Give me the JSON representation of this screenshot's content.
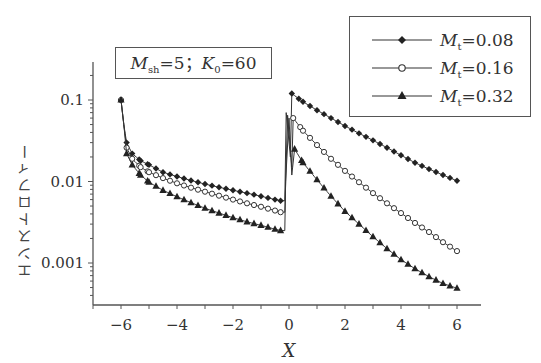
{
  "chart_data": {
    "type": "line",
    "title": "",
    "xlabel": "X",
    "ylabel": "エンストロフィー",
    "yscale": "log",
    "xlim": [
      -7,
      7.2
    ],
    "ylim": [
      0.0003,
      0.25
    ],
    "x_ticks": [
      -6,
      -4,
      -2,
      0,
      2,
      4,
      6
    ],
    "x_tick_labels": [
      "−6",
      "−4",
      "−2",
      "0",
      "2",
      "4",
      "6"
    ],
    "y_ticks": [
      0.1,
      0.01,
      0.001
    ],
    "y_tick_labels": [
      "0.1",
      "0.01",
      "0.001"
    ],
    "grid": false,
    "annotation": {
      "var1": "M",
      "sub1": "sh",
      "val1": "=5",
      "sep": "；",
      "var2": "K",
      "sub2": "0",
      "val2": "=60"
    },
    "legend_position": "upper right",
    "series": [
      {
        "name": "Mt=0.08",
        "legend_var": "M",
        "legend_sub": "t",
        "legend_val": "=0.08",
        "marker": "filled-diamond",
        "pre_shock": {
          "x": [
            -6.0,
            -5.9,
            -5.8,
            -5.6,
            -5.3,
            -5.0,
            -4.5,
            -4.0,
            -3.5,
            -3.0,
            -2.5,
            -2.0,
            -1.5,
            -1.0,
            -0.5,
            -0.3
          ],
          "y": [
            0.1,
            0.05,
            0.03,
            0.022,
            0.018,
            0.016,
            0.013,
            0.0115,
            0.0103,
            0.0093,
            0.0085,
            0.0078,
            0.0072,
            0.0066,
            0.006,
            0.0058
          ]
        },
        "post_shock": {
          "x": [
            0.1,
            0.5,
            1.0,
            1.5,
            2.0,
            2.5,
            3.0,
            3.5,
            4.0,
            4.5,
            5.0,
            5.5,
            6.0
          ],
          "y": [
            0.12,
            0.095,
            0.075,
            0.06,
            0.048,
            0.039,
            0.032,
            0.026,
            0.021,
            0.017,
            0.0142,
            0.012,
            0.0102
          ]
        }
      },
      {
        "name": "Mt=0.16",
        "legend_var": "M",
        "legend_sub": "t",
        "legend_val": "=0.16",
        "marker": "open-circle",
        "pre_shock": {
          "x": [
            -6.0,
            -5.9,
            -5.8,
            -5.6,
            -5.3,
            -5.0,
            -4.5,
            -4.0,
            -3.5,
            -3.0,
            -2.5,
            -2.0,
            -1.5,
            -1.0,
            -0.5,
            -0.3
          ],
          "y": [
            0.1,
            0.05,
            0.026,
            0.019,
            0.015,
            0.013,
            0.011,
            0.0095,
            0.0084,
            0.0075,
            0.0067,
            0.006,
            0.0054,
            0.0049,
            0.0044,
            0.0042
          ]
        },
        "post_shock": {
          "x": [
            0.15,
            0.5,
            1.0,
            1.5,
            2.0,
            2.5,
            3.0,
            3.5,
            4.0,
            4.5,
            5.0,
            5.5,
            6.0
          ],
          "y": [
            0.06,
            0.042,
            0.028,
            0.019,
            0.0135,
            0.0098,
            0.0072,
            0.0054,
            0.0041,
            0.0031,
            0.0024,
            0.0018,
            0.0014
          ]
        }
      },
      {
        "name": "Mt=0.32",
        "legend_var": "M",
        "legend_sub": "t",
        "legend_val": "=0.32",
        "marker": "filled-triangle",
        "pre_shock": {
          "x": [
            -6.0,
            -5.9,
            -5.8,
            -5.6,
            -5.3,
            -5.0,
            -4.5,
            -4.0,
            -3.5,
            -3.0,
            -2.5,
            -2.0,
            -1.5,
            -1.0,
            -0.5,
            -0.3
          ],
          "y": [
            0.1,
            0.05,
            0.022,
            0.016,
            0.012,
            0.0098,
            0.0078,
            0.0065,
            0.0055,
            0.0047,
            0.0041,
            0.0036,
            0.0032,
            0.0029,
            0.0026,
            0.0025
          ]
        },
        "post_shock": {
          "x": [
            0.2,
            0.5,
            1.0,
            1.5,
            2.0,
            2.5,
            3.0,
            3.5,
            4.0,
            4.5,
            5.0,
            5.5,
            6.0
          ],
          "y": [
            0.025,
            0.017,
            0.0105,
            0.0066,
            0.0043,
            0.003,
            0.0021,
            0.0015,
            0.0011,
            0.00085,
            0.00068,
            0.00056,
            0.00049
          ]
        }
      }
    ]
  }
}
